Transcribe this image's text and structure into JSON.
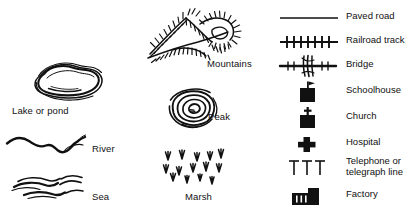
{
  "sheet": {
    "kind": "map-symbol-legend",
    "background_color": "#ffffff",
    "ink_color": "#111111"
  },
  "water_features": [
    {
      "symbol": "lake-contour-blob",
      "label": "Lake or pond"
    },
    {
      "symbol": "river-wavy-line",
      "label": "River"
    },
    {
      "symbol": "sea-wave-strokes",
      "label": "Sea"
    }
  ],
  "relief_features": [
    {
      "symbol": "mountains-hachure",
      "label": "Mountains"
    },
    {
      "symbol": "peak-concentric-contours",
      "label": "Peak"
    },
    {
      "symbol": "marsh-grass-tufts",
      "label": "Marsh"
    }
  ],
  "cultural_features": [
    {
      "symbol": "paved-road-line",
      "label": "Paved road"
    },
    {
      "symbol": "railroad-track-ticks",
      "label": "Railroad track"
    },
    {
      "symbol": "bridge-crosshatch",
      "label": "Bridge"
    },
    {
      "symbol": "schoolhouse-square-flag",
      "label": "Schoolhouse"
    },
    {
      "symbol": "church-square-cross",
      "label": "Church"
    },
    {
      "symbol": "hospital-cross",
      "label": "Hospital"
    },
    {
      "symbol": "telephone-line-poles",
      "label": "Telephone or\ntelegraph line"
    },
    {
      "symbol": "factory-building",
      "label": "Factory"
    }
  ]
}
